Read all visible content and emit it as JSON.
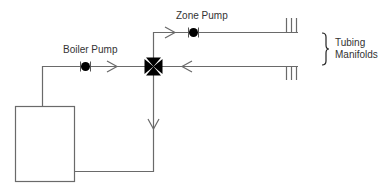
{
  "diagram": {
    "title": "",
    "colors": {
      "line": "#6a6a6a",
      "symbol": "#000000",
      "text": "#333333"
    },
    "labels": {
      "zone_pump": "Zone Pump",
      "boiler_pump": "Boiler Pump",
      "manifolds_line1": "Tubing",
      "manifolds_line2": "Manifolds"
    },
    "components": [
      {
        "id": "boiler",
        "type": "box"
      },
      {
        "id": "boiler-pump",
        "type": "pump",
        "label": "Boiler Pump"
      },
      {
        "id": "zone-pump",
        "type": "pump",
        "label": "Zone Pump"
      },
      {
        "id": "mixing-valve",
        "type": "3-way-valve"
      },
      {
        "id": "supply-manifold",
        "type": "manifold"
      },
      {
        "id": "return-manifold",
        "type": "manifold"
      }
    ]
  }
}
